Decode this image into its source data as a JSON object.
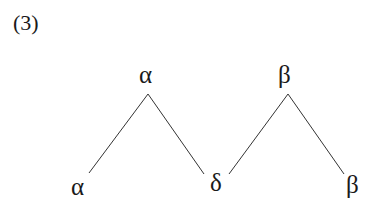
{
  "example_number": "(3)",
  "trees": [
    {
      "root": "α",
      "children": [
        "α",
        "δ"
      ]
    },
    {
      "root": "β",
      "children": [
        "δ",
        "β"
      ]
    }
  ],
  "nodes": {
    "root_left": "α",
    "root_right": "β",
    "leaf_left": "α",
    "leaf_shared": "δ",
    "leaf_right": "β"
  },
  "colors": {
    "ink": "#1a1a1a",
    "background": "#ffffff"
  }
}
